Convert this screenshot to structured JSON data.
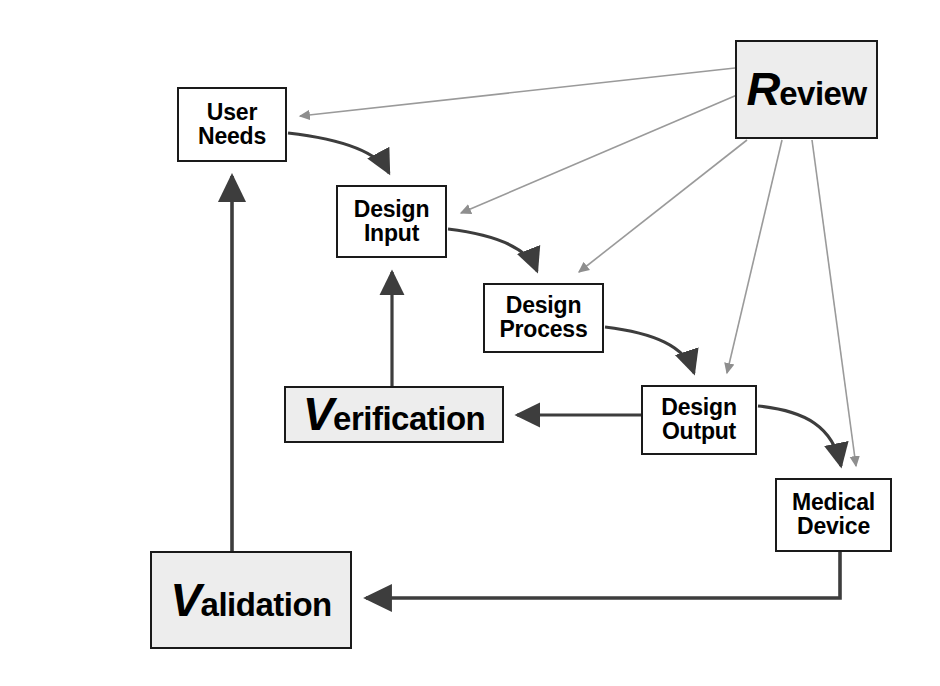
{
  "diagram": {
    "background_color": "#ffffff",
    "node_fill_plain": "#ffffff",
    "node_fill_shaded": "#ededed",
    "node_border_color": "#1a1a1a",
    "flow_arrow_color": "#3d3d3d",
    "review_arrow_color": "#9a9a9a",
    "nodes": [
      {
        "id": "user-needs",
        "label_line1": "User",
        "label_line2": "Needs",
        "cap": "",
        "rest": "",
        "style": "plain",
        "size": "small",
        "x": 177,
        "y": 87,
        "w": 110,
        "h": 75
      },
      {
        "id": "design-input",
        "label_line1": "Design",
        "label_line2": "Input",
        "cap": "",
        "rest": "",
        "style": "plain",
        "size": "small",
        "x": 336,
        "y": 185,
        "w": 111,
        "h": 73
      },
      {
        "id": "design-process",
        "label_line1": "Design",
        "label_line2": "Process",
        "cap": "",
        "rest": "",
        "style": "plain",
        "size": "small",
        "x": 483,
        "y": 283,
        "w": 121,
        "h": 70
      },
      {
        "id": "design-output",
        "label_line1": "Design",
        "label_line2": "Output",
        "cap": "",
        "rest": "",
        "style": "plain",
        "size": "small",
        "x": 641,
        "y": 385,
        "w": 116,
        "h": 70
      },
      {
        "id": "medical-device",
        "label_line1": "Medical",
        "label_line2": "Device",
        "cap": "",
        "rest": "",
        "style": "plain",
        "size": "small",
        "x": 775,
        "y": 478,
        "w": 117,
        "h": 74
      },
      {
        "id": "review",
        "label_line1": "",
        "label_line2": "",
        "cap": "R",
        "rest": "eview",
        "style": "shaded",
        "size": "big",
        "x": 735,
        "y": 40,
        "w": 143,
        "h": 99
      },
      {
        "id": "verification",
        "label_line1": "",
        "label_line2": "",
        "cap": "V",
        "rest": "erification",
        "style": "shaded",
        "size": "big",
        "x": 284,
        "y": 386,
        "w": 220,
        "h": 57
      },
      {
        "id": "validation",
        "label_line1": "",
        "label_line2": "",
        "cap": "V",
        "rest": "alidation",
        "style": "shaded",
        "size": "big",
        "x": 150,
        "y": 551,
        "w": 202,
        "h": 98
      }
    ],
    "edges": [
      {
        "id": "user-needs-to-design-input",
        "kind": "flow",
        "from": "user-needs",
        "to": "design-input"
      },
      {
        "id": "design-input-to-design-process",
        "kind": "flow",
        "from": "design-input",
        "to": "design-process"
      },
      {
        "id": "design-process-to-design-output",
        "kind": "flow",
        "from": "design-process",
        "to": "design-output"
      },
      {
        "id": "design-output-to-medical-device",
        "kind": "flow",
        "from": "design-output",
        "to": "medical-device"
      },
      {
        "id": "design-output-to-verification",
        "kind": "flow",
        "from": "design-output",
        "to": "verification"
      },
      {
        "id": "verification-to-design-input",
        "kind": "flow",
        "from": "verification",
        "to": "design-input"
      },
      {
        "id": "medical-device-to-validation",
        "kind": "flow",
        "from": "medical-device",
        "to": "validation"
      },
      {
        "id": "validation-to-user-needs",
        "kind": "flow",
        "from": "validation",
        "to": "user-needs"
      },
      {
        "id": "review-to-user-needs",
        "kind": "review",
        "from": "review",
        "to": "user-needs"
      },
      {
        "id": "review-to-design-input",
        "kind": "review",
        "from": "review",
        "to": "design-input"
      },
      {
        "id": "review-to-design-process",
        "kind": "review",
        "from": "review",
        "to": "design-process"
      },
      {
        "id": "review-to-design-output",
        "kind": "review",
        "from": "review",
        "to": "design-output"
      },
      {
        "id": "review-to-medical-device",
        "kind": "review",
        "from": "review",
        "to": "medical-device"
      }
    ]
  }
}
